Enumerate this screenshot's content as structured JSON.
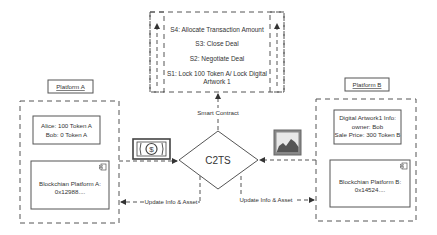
{
  "top_box": {
    "steps": [
      "S4: Allocate Transaction Amount",
      "S3: Close Deal",
      "S2: Negotiate Deal",
      "S1: Lock 100 Token A/ Lock Digital",
      "Artwork 1"
    ]
  },
  "center": {
    "label": "C2TS",
    "smart_contract_label": "Smart Contract"
  },
  "platform_a": {
    "title": "Platform A",
    "balance_line1": "Alice: 100 Token A",
    "balance_line2": "Bob: 0 Token A",
    "blockchain_line1": "Blockchian Platform A:",
    "blockchain_line2": "0x12988...."
  },
  "platform_b": {
    "title": "Platform B",
    "info_line1": "Digital Artwork1 Info:",
    "info_line2": "owner: Bob",
    "info_line3": "Sale Price: 300 Token B",
    "blockchain_line1": "Blockchian Platform B:",
    "blockchain_line2": "0x14524...."
  },
  "arrows": {
    "update_left": "Update Info & Asset",
    "update_right": "Update Info & Asset"
  },
  "icons": {
    "money": "money-bill-icon",
    "artwork": "picture-icon",
    "component": "component-icon"
  },
  "colors": {
    "stroke": "#555555",
    "text": "#333333"
  }
}
